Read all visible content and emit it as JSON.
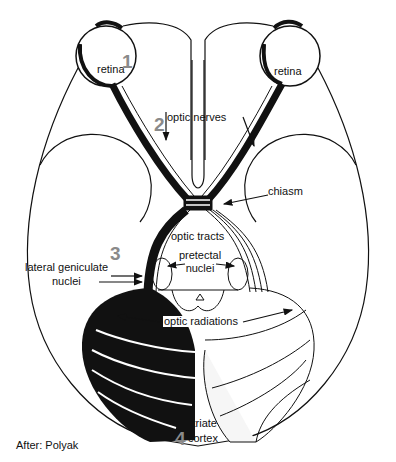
{
  "diagram": {
    "colors": {
      "ink": "#111111",
      "number": "#8a8a8a",
      "background": "#ffffff",
      "shade": "#f2f2f2"
    },
    "labels": {
      "retina_left": "retina",
      "retina_right": "retina",
      "optic_nerves": "optic nerves",
      "chiasm": "chiasm",
      "optic_tracts": "optic tracts",
      "pretectal_line1": "pretectal",
      "pretectal_line2": "nuclei",
      "lgn_line1": "lateral geniculate",
      "lgn_line2": "nuclei",
      "optic_radiations": "optic radiations",
      "striate_line1": "striate",
      "striate_line2": "cortex",
      "credit": "After: Polyak"
    },
    "numbers": {
      "n1": "1",
      "n2": "2",
      "n3": "3",
      "n4": "4"
    },
    "stages": [
      {
        "number": "1",
        "structure": "retina"
      },
      {
        "number": "2",
        "structure": "optic nerves"
      },
      {
        "number": "3",
        "structure": "lateral geniculate nuclei"
      },
      {
        "number": "4",
        "structure": "striate cortex"
      }
    ]
  }
}
